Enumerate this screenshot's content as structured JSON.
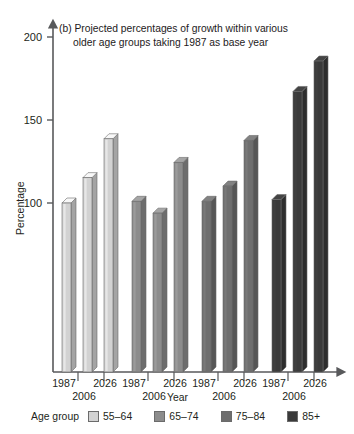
{
  "chart_data": {
    "type": "bar",
    "title": "(b) Projected percentages of growth within various older age groups taking 1987 as base year",
    "title_line1": "(b) Projected percentages of growth within various",
    "title_line2": "older age groups taking 1987 as base year",
    "xlabel": "Year",
    "ylabel": "Percentage",
    "ylim": [
      0,
      200
    ],
    "yticks": [
      100,
      150,
      200
    ],
    "ytick_labels": [
      "100",
      "150",
      "200"
    ],
    "grid": false,
    "legend_title": "Age group",
    "legend_position": "bottom",
    "categories": [
      "1987",
      "2006",
      "2026"
    ],
    "group_x_labels": [
      {
        "upper_left": "1987",
        "lower_mid": "2006",
        "upper_right": "2026"
      },
      {
        "upper_left": "1987",
        "lower_mid": "2006",
        "upper_right": "2026"
      },
      {
        "upper_left": "1987",
        "lower_mid": "2006",
        "upper_right": "2026"
      },
      {
        "upper_left": "1987",
        "lower_mid": "2006",
        "upper_right": "2026"
      }
    ],
    "series": [
      {
        "name": "55–64",
        "color": "#d2d2d2",
        "values": [
          100,
          115,
          138
        ]
      },
      {
        "name": "65–74",
        "color": "#8c8c8c",
        "values": [
          101,
          94,
          124
        ]
      },
      {
        "name": "75–84",
        "color": "#6e6e6e",
        "values": [
          101,
          110,
          137
        ]
      },
      {
        "name": "85+",
        "color": "#3a3a3a",
        "values": [
          102,
          166,
          184
        ]
      }
    ]
  },
  "legend": {
    "title": "Age group",
    "items": [
      {
        "label": "55–64",
        "color": "#d2d2d2"
      },
      {
        "label": "65–74",
        "color": "#8c8c8c"
      },
      {
        "label": "75–84",
        "color": "#6e6e6e"
      },
      {
        "label": "85+",
        "color": "#3a3a3a"
      }
    ]
  },
  "axes": {
    "y_label": "Percentage",
    "x_label": "Year",
    "y_tick_0": "200",
    "y_tick_1": "150",
    "y_tick_2": "100"
  },
  "x_labels": {
    "g0_1987": "1987",
    "g0_2006": "2006",
    "g0_2026": "2026",
    "g1_1987": "1987",
    "g1_2006": "2006",
    "g1_2026": "2026",
    "g2_1987": "1987",
    "g2_2006": "2006",
    "g2_2026": "2026",
    "g3_1987": "1987",
    "g3_2006": "2006",
    "g3_2026": "2026"
  }
}
